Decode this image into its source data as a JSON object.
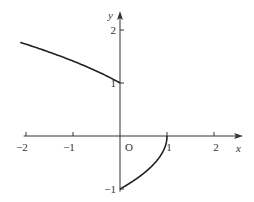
{
  "chart_data": {
    "type": "line",
    "title": "",
    "xlabel": "x",
    "ylabel": "y",
    "origin_label": "O",
    "xlim": [
      -2.1,
      2.6
    ],
    "ylim": [
      -1.1,
      2.3
    ],
    "x_ticks": [
      -2,
      -1,
      1,
      2
    ],
    "x_tick_labels": [
      "−2",
      "−1",
      "1",
      "2"
    ],
    "y_ticks": [
      2,
      1,
      -1
    ],
    "y_tick_labels": [
      "2",
      "1",
      "−1"
    ],
    "grid": false,
    "series": [
      {
        "name": "upper branch (x<0)",
        "description": "y = sqrt(1 - x)",
        "x": [
          -2.0,
          -1.5,
          -1.0,
          -0.5,
          0.0
        ],
        "y": [
          1.73,
          1.58,
          1.41,
          1.22,
          1.0
        ]
      },
      {
        "name": "lower branch (0<=x<=1)",
        "description": "y = -sqrt(1 - x)",
        "x": [
          0.0,
          0.25,
          0.5,
          0.75,
          0.9,
          1.0
        ],
        "y": [
          -1.0,
          -0.87,
          -0.71,
          -0.5,
          -0.32,
          0.0
        ]
      }
    ],
    "colors": {
      "curve": "#222222",
      "axis": "#333333"
    }
  }
}
